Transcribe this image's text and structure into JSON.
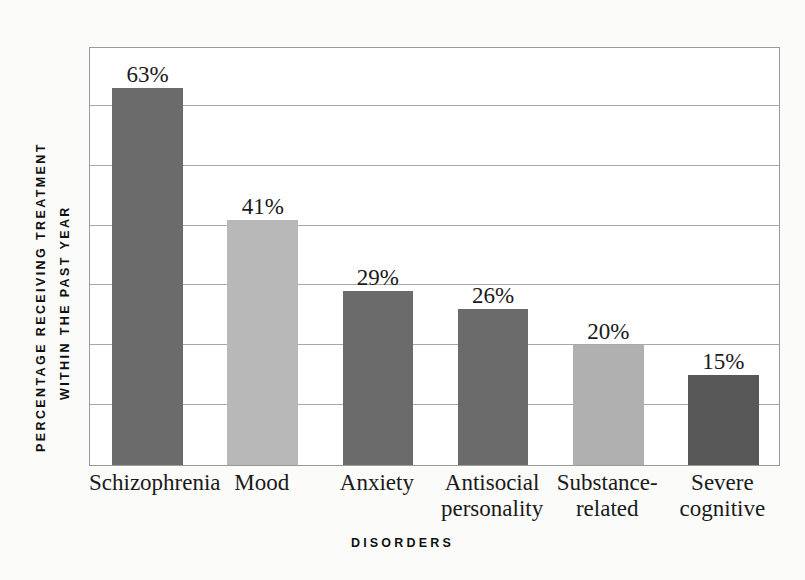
{
  "chart_data": {
    "type": "bar",
    "title": "",
    "xlabel": "DISORDERS",
    "ylabel_line1": "PERCENTAGE RECEIVING TREATMENT",
    "ylabel_line2": "WITHIN THE PAST YEAR",
    "categories": [
      "Schizophrenia",
      "Mood",
      "Anxiety",
      "Antisocial personality",
      "Substance-related",
      "Severe cognitive"
    ],
    "category_lines": [
      [
        "Schizophrenia"
      ],
      [
        "Mood"
      ],
      [
        "Anxiety"
      ],
      [
        "Antisocial",
        "personality"
      ],
      [
        "Substance-",
        "related"
      ],
      [
        "Severe",
        "cognitive"
      ]
    ],
    "values": [
      63,
      41,
      29,
      26,
      20,
      15
    ],
    "value_labels": [
      "63%",
      "41%",
      "29%",
      "26%",
      "20%",
      "15%"
    ],
    "bar_colors": [
      "#6b6b6b",
      "#b8b8b8",
      "#6b6b6b",
      "#6b6b6b",
      "#b0b0b0",
      "#585858"
    ],
    "ylim": [
      0,
      70
    ],
    "gridline_values": [
      10,
      20,
      30,
      40,
      50,
      60
    ],
    "grid": true,
    "legend": "none",
    "axis_color": "#9a9a9a",
    "gridline_color": "#a8a8a8",
    "background_color": "#fbfbf9",
    "plot_background_color": "#ffffff",
    "text_color": "#1a1a1a"
  }
}
